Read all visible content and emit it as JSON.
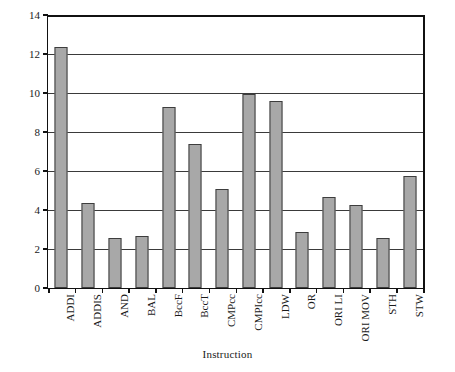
{
  "chart_data": {
    "type": "bar",
    "title": "",
    "xlabel": "Instruction",
    "ylabel": "Percentage",
    "ylim": [
      0,
      14
    ],
    "yticks": [
      0,
      2,
      4,
      6,
      8,
      10,
      12,
      14
    ],
    "grid": true,
    "legend": null,
    "bar_color": "#a8a8a8",
    "bar_edge_color": "#3d3d3d",
    "categories": [
      "ADDI",
      "ADDIS",
      "AND",
      "BAL",
      "BccF",
      "BccT",
      "CMPcc",
      "CMPIcc",
      "LDW",
      "OR",
      "ORI LI",
      "ORI MOV",
      "STH",
      "STW"
    ],
    "values": [
      12.35,
      4.36,
      2.56,
      2.67,
      9.28,
      7.38,
      5.08,
      9.95,
      9.6,
      2.87,
      4.67,
      4.26,
      2.56,
      5.74
    ]
  }
}
